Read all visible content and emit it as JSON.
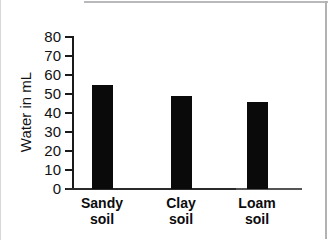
{
  "chart_data": {
    "type": "bar",
    "title": "",
    "subtitle": "",
    "xlabel": "",
    "ylabel": "Water in mL",
    "categories": [
      "Sandy\nsoil",
      "Clay\nsoil",
      "Loam\nsoil"
    ],
    "category_lines": [
      [
        "Sandy",
        "soil"
      ],
      [
        "Clay",
        "soil"
      ],
      [
        "Loam",
        "soil"
      ]
    ],
    "values": [
      55,
      49,
      46
    ],
    "ylim": [
      0,
      80
    ],
    "yticks": [
      0,
      10,
      20,
      30,
      40,
      50,
      60,
      70,
      80
    ],
    "ytick_labels": [
      "0",
      "10",
      "20",
      "30",
      "40",
      "50",
      "60",
      "70",
      "80"
    ],
    "grid": false,
    "legend": null,
    "legend_position": "none",
    "bar_color": "#0a0a0a",
    "axis_color": "#1a1a1a",
    "background": "#ffffff"
  }
}
